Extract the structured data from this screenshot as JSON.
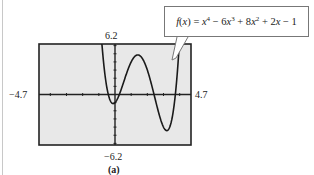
{
  "chart_data": {
    "type": "line",
    "title": "",
    "function_label": "f(x) = x^4 − 6x^3 + 8x^2 + 2x − 1",
    "coefficients": [
      1,
      -6,
      8,
      2,
      -1
    ],
    "xlim": [
      -4.7,
      4.7
    ],
    "ylim": [
      -6.2,
      6.2
    ],
    "tick_labels": {
      "xmin": "−4.7",
      "xmax": "4.7",
      "ymin": "−6.2",
      "ymax": "6.2"
    },
    "x_tick_step": 1,
    "y_tick_step": 1,
    "grid": false,
    "caption": "(a)",
    "sample_points": [
      {
        "x": -0.5,
        "y": -0.19
      },
      {
        "x": -0.12,
        "y": -1.13
      },
      {
        "x": 0,
        "y": -1
      },
      {
        "x": 1.2,
        "y": 4.63
      },
      {
        "x": 2,
        "y": 3
      },
      {
        "x": 3,
        "y": -4
      },
      {
        "x": 3.3,
        "y": -4.3
      },
      {
        "x": 4,
        "y": 7
      }
    ]
  },
  "labels": {
    "ymax": "6.2",
    "ymin": "−6.2",
    "xmin": "−4.7",
    "xmax": "4.7",
    "caption": "(a)"
  },
  "colors": {
    "screen_bg": "#e8e8e8",
    "frame": "#222222",
    "curve": "#1a1a1a"
  }
}
